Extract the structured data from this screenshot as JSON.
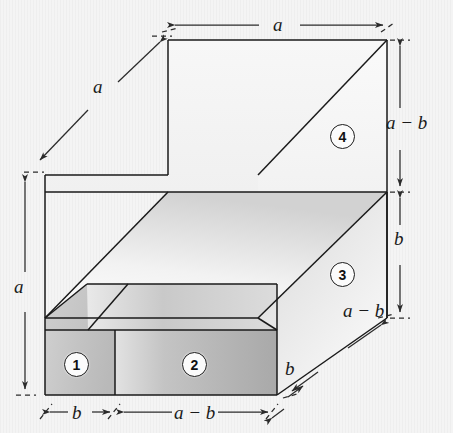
{
  "figure": {
    "background_color": "#f4f4f4",
    "line_color": "#1a1a1a"
  },
  "dimensions": [
    {
      "id": "top-horizontal-a",
      "label": "a",
      "orientation": "horizontal",
      "position": "top"
    },
    {
      "id": "top-left-diagonal-a",
      "label": "a",
      "orientation": "diagonal",
      "position": "top-left"
    },
    {
      "id": "right-upper-a-minus-b",
      "label": "a − b",
      "orientation": "vertical",
      "position": "right-upper"
    },
    {
      "id": "right-lower-b",
      "label": "b",
      "orientation": "vertical",
      "position": "right-lower"
    },
    {
      "id": "left-vertical-a",
      "label": "a",
      "orientation": "vertical",
      "position": "left"
    },
    {
      "id": "bottom-b",
      "label": "b",
      "orientation": "horizontal",
      "position": "bottom-left"
    },
    {
      "id": "bottom-a-minus-b",
      "label": "a − b",
      "orientation": "horizontal",
      "position": "bottom-center"
    },
    {
      "id": "lower-right-diagonal-a-minus-b",
      "label": "a − b",
      "orientation": "diagonal",
      "position": "lower-right"
    },
    {
      "id": "lower-right-diagonal-b",
      "label": "b",
      "orientation": "diagonal",
      "position": "bottom-right"
    }
  ],
  "regions": [
    {
      "number": "1",
      "description": "front-left small slab face"
    },
    {
      "number": "2",
      "description": "front-right slab face"
    },
    {
      "number": "3",
      "description": "right side slab face"
    },
    {
      "number": "4",
      "description": "upper right back face"
    }
  ],
  "labels": {
    "a": "a",
    "b": "b",
    "a_minus_b": "a − b"
  }
}
